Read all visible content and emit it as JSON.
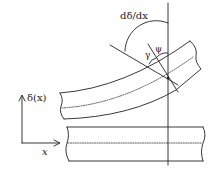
{
  "diagram": {
    "type": "beam-deflection-geometry",
    "labels": {
      "slope": "dδ/dx",
      "gamma": "γ",
      "psi": "ψ",
      "deflection_axis": "δ(x)",
      "x_axis": "x"
    },
    "elements": {
      "undeformed_beam": "straight beam with dashed neutral axis",
      "deformed_beam": "curved beam with dashed neutral axis",
      "vertical_reference_line": "vertical line through reference point",
      "tangent_line": "line tangent to deformed beam surface",
      "normal_line": "cross-section line normal to beam",
      "angle_arcs": [
        "dδ/dx arc",
        "γ arc",
        "ψ arc"
      ]
    },
    "colors": {
      "line": "#222222",
      "background": "#ffffff"
    }
  }
}
